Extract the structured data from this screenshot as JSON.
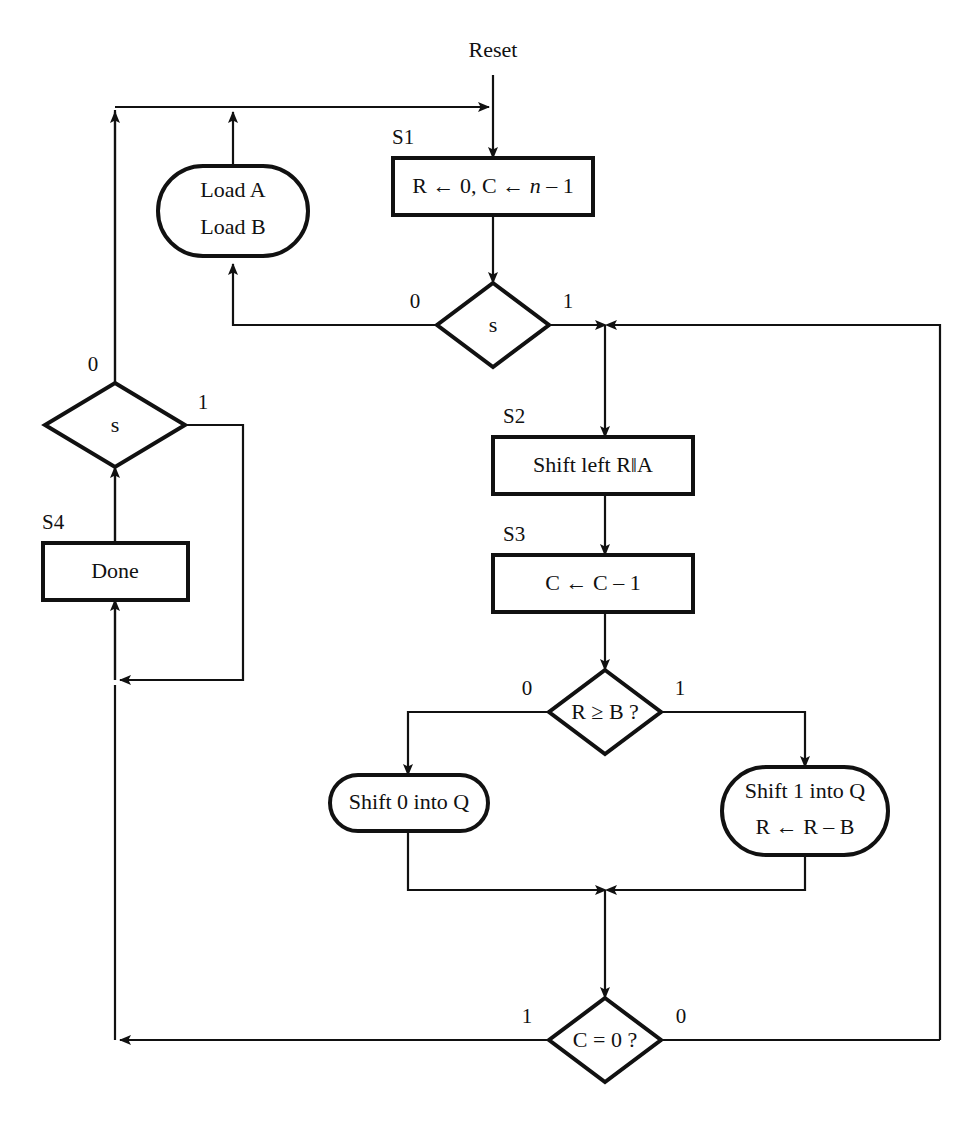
{
  "diagram": {
    "entry_label": "Reset",
    "background_color": "#ffffff",
    "line_color": "#111111",
    "nodes": [
      {
        "id": "s1",
        "state": "S1",
        "shape": "rect",
        "lines": [
          "R ← 0, C ← n – 1"
        ],
        "italic_token": "n"
      },
      {
        "id": "load",
        "state": "",
        "shape": "stadium",
        "lines": [
          "Load A",
          "Load B"
        ]
      },
      {
        "id": "s_top",
        "state": "",
        "shape": "diamond",
        "lines": [
          "s"
        ],
        "branch_left": "0",
        "branch_right": "1"
      },
      {
        "id": "s_left",
        "state": "",
        "shape": "diamond",
        "lines": [
          "s"
        ],
        "branch_top": "0",
        "branch_right": "1"
      },
      {
        "id": "s4",
        "state": "S4",
        "shape": "rect",
        "lines": [
          "Done"
        ]
      },
      {
        "id": "s2",
        "state": "S2",
        "shape": "rect",
        "lines": [
          "Shift left R‖A"
        ]
      },
      {
        "id": "s3",
        "state": "S3",
        "shape": "rect",
        "lines": [
          "C ← C – 1"
        ]
      },
      {
        "id": "rb",
        "state": "",
        "shape": "diamond",
        "lines": [
          "R ≥ B ?"
        ],
        "branch_left": "0",
        "branch_right": "1"
      },
      {
        "id": "shift0",
        "state": "",
        "shape": "stadium",
        "lines": [
          "Shift 0 into Q"
        ]
      },
      {
        "id": "shift1",
        "state": "",
        "shape": "stadium",
        "lines": [
          "Shift 1 into Q",
          "R ← R – B"
        ]
      },
      {
        "id": "c0",
        "state": "",
        "shape": "diamond",
        "lines": [
          "C = 0 ?"
        ],
        "branch_left": "1",
        "branch_right": "0"
      }
    ],
    "edge_labels": {
      "s_top_zero": "0",
      "s_top_one": "1",
      "s_left_zero": "0",
      "s_left_one": "1",
      "rb_zero": "0",
      "rb_one": "1",
      "c0_one": "1",
      "c0_zero": "0"
    }
  }
}
